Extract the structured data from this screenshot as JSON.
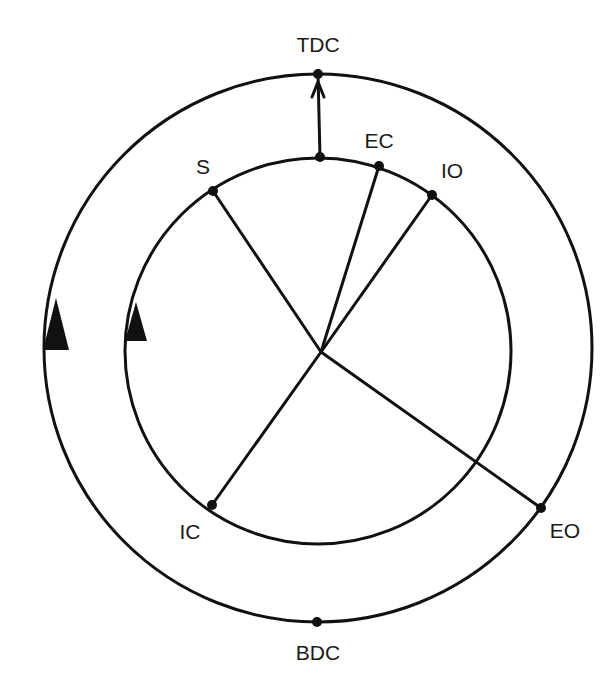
{
  "diagram": {
    "type": "valve-timing-diagram",
    "labels": {
      "tdc": "TDC",
      "bdc": "BDC",
      "s": "S",
      "ec": "EC",
      "io": "IO",
      "ic": "IC",
      "eo": "EO"
    },
    "colors": {
      "line": "#111111",
      "background": "#ffffff",
      "text": "#1a1a1a"
    },
    "outer_circle": {
      "cx": 318,
      "cy": 348,
      "r": 274
    },
    "inner_circle": {
      "cx": 318,
      "cy": 351,
      "r": 193
    },
    "center": {
      "x": 321,
      "y": 352
    },
    "points": {
      "tdc_outer": {
        "x": 318,
        "y": 74
      },
      "tdc_inner": {
        "x": 320,
        "y": 157
      },
      "bdc": {
        "x": 317,
        "y": 622
      },
      "s": {
        "x": 213,
        "y": 191
      },
      "ec": {
        "x": 379,
        "y": 166
      },
      "io": {
        "x": 432,
        "y": 195
      },
      "ic": {
        "x": 212,
        "y": 505
      },
      "eo": {
        "x": 541,
        "y": 508
      }
    },
    "rotation_direction": "clockwise"
  }
}
